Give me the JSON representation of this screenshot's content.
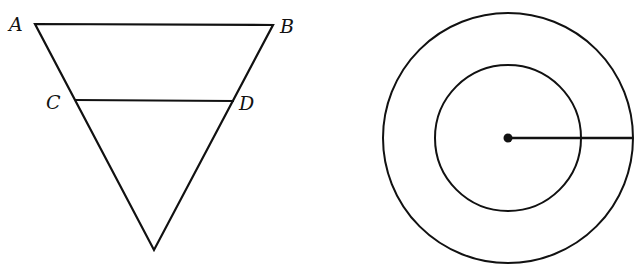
{
  "diagram": {
    "stroke_color": "#111111",
    "background": "#ffffff",
    "triangle": {
      "vertices": {
        "A": [
          35,
          24
        ],
        "B": [
          273,
          25
        ],
        "apex": [
          154,
          250
        ]
      },
      "segment_CD": {
        "C": [
          75,
          100
        ],
        "D": [
          234,
          101
        ]
      },
      "labels": {
        "A": "A",
        "B": "B",
        "C": "C",
        "D": "D"
      }
    },
    "circles": {
      "center": [
        508,
        138
      ],
      "outer_radius": 125,
      "inner_radius": 73,
      "radius_line_end": [
        633,
        138
      ]
    }
  }
}
